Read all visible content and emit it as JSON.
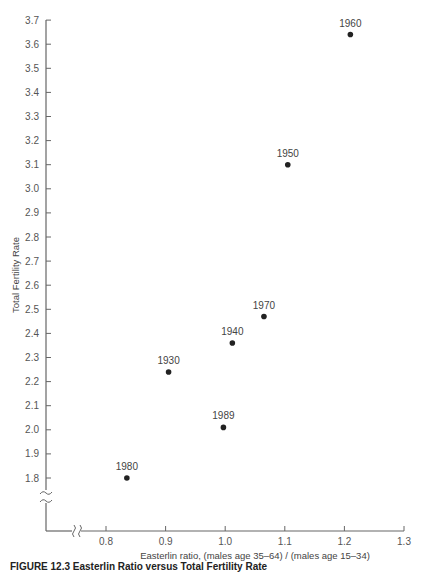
{
  "chart_data": {
    "type": "scatter",
    "title": "",
    "xlabel": "Easterlin ratio, (males age 35–64) / (males age 15–34)",
    "ylabel": "Total Fertility Rate",
    "xlim": [
      0.8,
      1.3
    ],
    "ylim": [
      1.8,
      3.7
    ],
    "x_ticks": [
      "0.8",
      "0.9",
      "1.0",
      "1.1",
      "1.2",
      "1.3"
    ],
    "y_ticks": [
      "1.8",
      "1.9",
      "2.0",
      "2.1",
      "2.2",
      "2.3",
      "2.4",
      "2.5",
      "2.6",
      "2.7",
      "2.8",
      "2.9",
      "3.0",
      "3.1",
      "3.2",
      "3.3",
      "3.4",
      "3.5",
      "3.6",
      "3.7"
    ],
    "axis_breaks": {
      "x": true,
      "y": true
    },
    "grid": false,
    "legend": null,
    "points": [
      {
        "label": "1930",
        "x": 0.905,
        "y": 2.24
      },
      {
        "label": "1940",
        "x": 1.012,
        "y": 2.36
      },
      {
        "label": "1950",
        "x": 1.105,
        "y": 3.1
      },
      {
        "label": "1960",
        "x": 1.21,
        "y": 3.64
      },
      {
        "label": "1970",
        "x": 1.065,
        "y": 2.47
      },
      {
        "label": "1980",
        "x": 0.835,
        "y": 1.8
      },
      {
        "label": "1989",
        "x": 0.997,
        "y": 2.01
      }
    ]
  },
  "caption": "FIGURE 12.3   Easterlin Ratio versus Total Fertility Rate"
}
